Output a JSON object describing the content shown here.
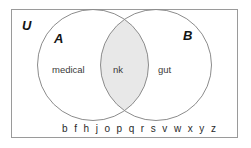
{
  "figure": {
    "type": "venn-diagram",
    "universe_label": "U",
    "background_color": "#ffffff",
    "frame_color": "#9a9a9a",
    "circle_stroke_color": "#8c8c8c",
    "intersection_fill_color": "#e8e8e8",
    "circle_fill_color": "#ffffff"
  },
  "sets": {
    "a": {
      "letter": "A",
      "only_label": "medical"
    },
    "b": {
      "letter": "B",
      "only_label": "gut"
    },
    "intersection": {
      "label": "nk"
    }
  },
  "outside": {
    "elements_label": "b f h j o p q r s v w x y z"
  }
}
